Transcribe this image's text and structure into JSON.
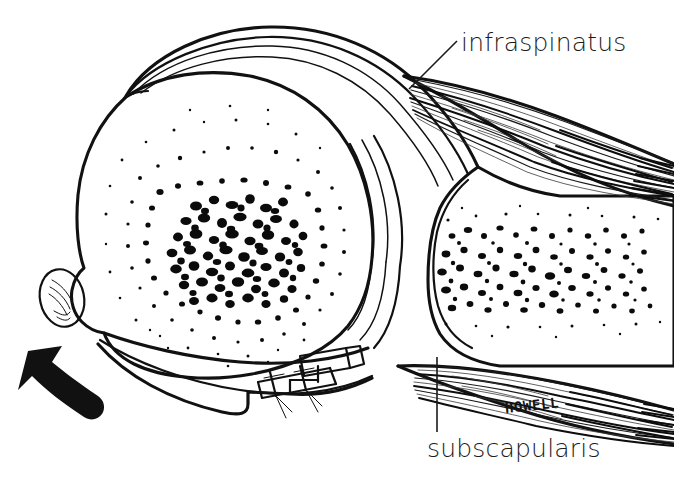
{
  "figure": {
    "background_color": "#ffffff",
    "ink_color": "#111111",
    "width": 674,
    "height": 487
  },
  "labels": {
    "infraspinatus": "infraspinatus",
    "subscapularis": "subscapularis"
  },
  "signature": {
    "artist": "HOWELL"
  },
  "annotations": {
    "motion_arrow": "curved-arrow-pointing-upper-left"
  },
  "structures": [
    {
      "name": "humeral-head",
      "texture": "dense-stipple"
    },
    {
      "name": "glenoid-scapula",
      "texture": "dense-stipple"
    },
    {
      "name": "joint-capsule",
      "texture": "parallel-arcs"
    },
    {
      "name": "bicipital-groove",
      "texture": "oval-with-hatching"
    },
    {
      "name": "surgical-sutures",
      "texture": "stitch-marks"
    },
    {
      "name": "infraspinatus-muscle",
      "texture": "fiber-striations"
    },
    {
      "name": "subscapularis-muscle",
      "texture": "fiber-striations"
    }
  ]
}
